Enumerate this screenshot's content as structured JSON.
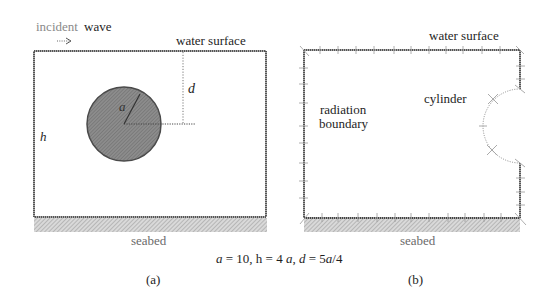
{
  "panel_a": {
    "label": "(a)",
    "incident_text_1": "incident",
    "incident_text_2": "wave",
    "water_surface": "water surface",
    "seabed": "seabed",
    "depth_symbol": "h",
    "submergence_symbol": "d",
    "radius_symbol": "a",
    "colors": {
      "boundary": "#555555",
      "cylinder_fill": "#7d7d7d",
      "cylinder_edge": "#4a4a4a",
      "seabed_hatch": "#b5b5b5",
      "dotted": "#777777"
    }
  },
  "panel_b": {
    "label": "(b)",
    "water_surface": "water surface",
    "seabed": "seabed",
    "radiation_line1": "radiation",
    "radiation_line2": "boundary",
    "cylinder": "cylinder"
  },
  "caption": {
    "a_sym": "a",
    "a_val": " = 10, h = 4 ",
    "a_sym2": "a",
    "sep": ", ",
    "d_sym": "d",
    "d_val": " = 5",
    "a_sym3": "a",
    "d_tail": "/4"
  }
}
